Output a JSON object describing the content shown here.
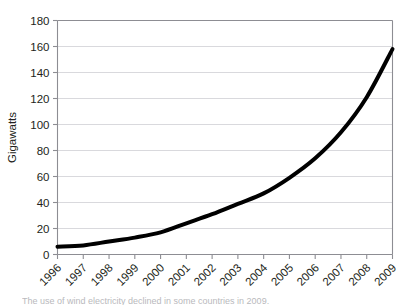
{
  "figure": {
    "top_cut_text": " ",
    "caption_cut_text": "The use of wind electricity declined in some countries in 2009."
  },
  "chart_data": {
    "type": "line",
    "title": "",
    "subtitle": "",
    "xlabel": "",
    "ylabel": "Gigawatts",
    "x": [
      1996,
      1997,
      1998,
      1999,
      2000,
      2001,
      2002,
      2003,
      2004,
      2005,
      2006,
      2007,
      2008,
      2009
    ],
    "categories": [
      "1996",
      "1997",
      "1998",
      "1999",
      "2000",
      "2001",
      "2002",
      "2003",
      "2004",
      "2005",
      "2006",
      "2007",
      "2008",
      "2009"
    ],
    "values": [
      6,
      7,
      10,
      13,
      17,
      24,
      31,
      39,
      47,
      59,
      74,
      94,
      121,
      158
    ],
    "series": [
      {
        "name": "Gigawatts",
        "values": [
          6,
          7,
          10,
          13,
          17,
          24,
          31,
          39,
          47,
          59,
          74,
          94,
          121,
          158
        ],
        "color": "#000000",
        "line_width": 4
      }
    ],
    "xlim": [
      1996,
      2009
    ],
    "ylim": [
      0,
      180
    ],
    "yticks": [
      0,
      20,
      40,
      60,
      80,
      100,
      120,
      140,
      160,
      180
    ],
    "ytick_labels": [
      "0",
      "20",
      "40",
      "60",
      "80",
      "100",
      "120",
      "140",
      "160",
      "180"
    ],
    "xtick_labels": [
      "1996",
      "1997",
      "1998",
      "1999",
      "2000",
      "2001",
      "2002",
      "2003",
      "2004",
      "2005",
      "2006",
      "2007",
      "2008",
      "2009"
    ],
    "xtick_label_rotation": -45,
    "grid": {
      "horizontal": true,
      "vertical": false,
      "color": "#d9d9dd"
    },
    "legend": {
      "visible": false,
      "position": "none"
    },
    "axis_color": "#8d8d93",
    "text_color": "#231f20",
    "background": "#ffffff"
  }
}
